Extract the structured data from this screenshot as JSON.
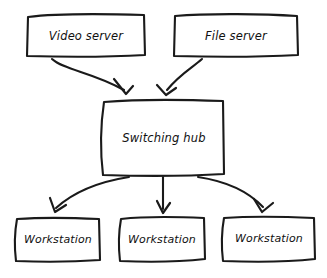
{
  "diagram": {
    "type": "network-topology-flow",
    "style": "hand-drawn sketch",
    "canvas": {
      "width": 327,
      "height": 278
    },
    "colors": {
      "background": "#ffffff",
      "stroke": "#1a1a1a",
      "text": "#111111",
      "fill": "#ffffff"
    },
    "nodes": [
      {
        "id": "video-server",
        "label": "Video server",
        "tier": "top",
        "box": {
          "x": 26,
          "y": 14,
          "w": 119,
          "h": 43
        }
      },
      {
        "id": "file-server",
        "label": "File server",
        "tier": "top",
        "box": {
          "x": 173,
          "y": 14,
          "w": 125,
          "h": 43
        }
      },
      {
        "id": "switching-hub",
        "label": "Switching hub",
        "tier": "middle",
        "box": {
          "x": 102,
          "y": 100,
          "w": 122,
          "h": 75
        }
      },
      {
        "id": "workstation-left",
        "label": "Workstation",
        "tier": "bottom",
        "box": {
          "x": 14,
          "y": 217,
          "w": 86,
          "h": 45
        }
      },
      {
        "id": "workstation-center",
        "label": "Workstation",
        "tier": "bottom",
        "box": {
          "x": 118,
          "y": 217,
          "w": 87,
          "h": 45
        }
      },
      {
        "id": "workstation-right",
        "label": "Workstation",
        "tier": "bottom",
        "box": {
          "x": 222,
          "y": 217,
          "w": 93,
          "h": 45
        }
      }
    ],
    "edges": [
      {
        "id": "edge-video-to-hub",
        "from": "video-server",
        "to": "switching-hub",
        "shape": "curved",
        "arrowhead": "open-v"
      },
      {
        "id": "edge-file-to-hub",
        "from": "file-server",
        "to": "switching-hub",
        "shape": "curved",
        "arrowhead": "open-v"
      },
      {
        "id": "edge-hub-to-ws-left",
        "from": "switching-hub",
        "to": "workstation-left",
        "shape": "curved",
        "arrowhead": "open-v"
      },
      {
        "id": "edge-hub-to-ws-center",
        "from": "switching-hub",
        "to": "workstation-center",
        "shape": "straight",
        "arrowhead": "open-v"
      },
      {
        "id": "edge-hub-to-ws-right",
        "from": "switching-hub",
        "to": "workstation-right",
        "shape": "curved",
        "arrowhead": "open-v"
      }
    ]
  }
}
